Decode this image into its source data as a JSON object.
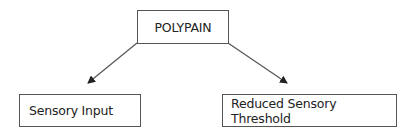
{
  "diagram": {
    "type": "hierarchy",
    "root": {
      "label": "POLYPAIN"
    },
    "children": [
      {
        "label": "Sensory Input"
      },
      {
        "label": "Reduced Sensory Threshold"
      }
    ],
    "edges": [
      {
        "from": "POLYPAIN",
        "to": "Sensory Input",
        "style": "arrow"
      },
      {
        "from": "POLYPAIN",
        "to": "Reduced Sensory Threshold",
        "style": "arrow"
      }
    ],
    "colors": {
      "stroke": "#555555",
      "text": "#222222",
      "background": "#ffffff"
    }
  }
}
